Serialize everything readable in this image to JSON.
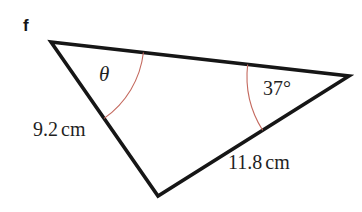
{
  "figure": {
    "kind": "triangle-diagram",
    "question_label": "f",
    "background_color": "#ffffff",
    "stroke_color": "#161616",
    "arc_color": "#c4695e",
    "stroke_width": 3.6,
    "arc_width": 1.1,
    "vertices": {
      "top_left": {
        "x": 51,
        "y": 42
      },
      "right": {
        "x": 349,
        "y": 76
      },
      "bottom": {
        "x": 158,
        "y": 196
      }
    },
    "angles": {
      "theta": {
        "symbol": "θ",
        "at_vertex": "top_left",
        "arc_radius": 93,
        "unknown": true
      },
      "known": {
        "value": "37°",
        "at_vertex": "right",
        "arc_radius": 102
      }
    },
    "sides": [
      {
        "name": "left-side",
        "value": "9.2",
        "unit": "cm",
        "from": "top_left",
        "to": "bottom"
      },
      {
        "name": "bottom-right-side",
        "value": "11.8",
        "unit": "cm",
        "from": "bottom",
        "to": "right"
      }
    ]
  }
}
